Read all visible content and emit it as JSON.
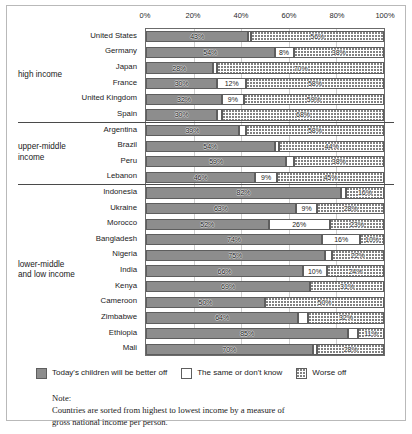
{
  "chart_data": {
    "type": "bar",
    "orientation": "horizontal",
    "stacked": true,
    "title": "",
    "xlabel": "",
    "ylabel": "",
    "xlim": [
      0,
      100
    ],
    "grid": true,
    "legend_position": "bottom",
    "axis_ticks": [
      "0%",
      "20%",
      "40%",
      "60%",
      "80%",
      "100%"
    ],
    "axis_tick_values": [
      0,
      20,
      40,
      60,
      80,
      100
    ],
    "series": [
      {
        "name": "Today's children will be better off",
        "key": "better",
        "color": "#8d8d8d",
        "pattern": "solid-gray"
      },
      {
        "name": "The same or don't know",
        "key": "same",
        "color": "#ffffff",
        "pattern": "white"
      },
      {
        "name": "Worse off",
        "key": "worse",
        "color": "#ffffff",
        "pattern": "dotted"
      }
    ],
    "groups": [
      {
        "label_lines": [
          "high income"
        ],
        "countries": [
          {
            "name": "United States",
            "better": 43,
            "same": 1,
            "worse": 56,
            "labels": {
              "better": "43%",
              "same": "",
              "worse": "56%"
            }
          },
          {
            "name": "Germany",
            "better": 54,
            "same": 8,
            "worse": 38,
            "labels": {
              "better": "54%",
              "same": "8%",
              "worse": "38%"
            }
          },
          {
            "name": "Japan",
            "better": 28,
            "same": 2,
            "worse": 70,
            "labels": {
              "better": "28%",
              "same": "",
              "worse": "70%"
            }
          },
          {
            "name": "France",
            "better": 30,
            "same": 12,
            "worse": 58,
            "labels": {
              "better": "30%",
              "same": "12%",
              "worse": "58%"
            }
          },
          {
            "name": "United Kingdom",
            "better": 32,
            "same": 9,
            "worse": 59,
            "labels": {
              "better": "32%",
              "same": "9%",
              "worse": "59%"
            }
          },
          {
            "name": "Spain",
            "better": 30,
            "same": 2,
            "worse": 68,
            "labels": {
              "better": "30%",
              "same": "",
              "worse": "68%"
            }
          }
        ]
      },
      {
        "label_lines": [
          "upper-middle",
          "income"
        ],
        "countries": [
          {
            "name": "Argentina",
            "better": 39,
            "same": 3,
            "worse": 58,
            "labels": {
              "better": "39%",
              "same": "",
              "worse": "58%"
            }
          },
          {
            "name": "Brazil",
            "better": 54,
            "same": 2,
            "worse": 44,
            "labels": {
              "better": "54%",
              "same": "",
              "worse": "44%"
            }
          },
          {
            "name": "Peru",
            "better": 59,
            "same": 3,
            "worse": 38,
            "labels": {
              "better": "59%",
              "same": "",
              "worse": "38%"
            }
          },
          {
            "name": "Lebanon",
            "better": 46,
            "same": 9,
            "worse": 45,
            "labels": {
              "better": "46%",
              "same": "9%",
              "worse": "45%"
            }
          }
        ]
      },
      {
        "label_lines": [
          "lower-middle",
          "and low income"
        ],
        "countries": [
          {
            "name": "Indonesia",
            "better": 82,
            "same": 2,
            "worse": 16,
            "labels": {
              "better": "82%",
              "same": "",
              "worse": "16%"
            }
          },
          {
            "name": "Ukraine",
            "better": 63,
            "same": 9,
            "worse": 28,
            "labels": {
              "better": "63%",
              "same": "9%",
              "worse": "28%"
            }
          },
          {
            "name": "Morocco",
            "better": 52,
            "same": 26,
            "worse": 23,
            "labels": {
              "better": "52%",
              "same": "26%",
              "worse": "23%"
            }
          },
          {
            "name": "Bangladesh",
            "better": 74,
            "same": 16,
            "worse": 10,
            "labels": {
              "better": "74%",
              "same": "16%",
              "worse": "10%"
            }
          },
          {
            "name": "Nigeria",
            "better": 75,
            "same": 3,
            "worse": 22,
            "labels": {
              "better": "75%",
              "same": "",
              "worse": "22%"
            }
          },
          {
            "name": "India",
            "better": 66,
            "same": 10,
            "worse": 24,
            "labels": {
              "better": "66%",
              "same": "10%",
              "worse": "24%"
            }
          },
          {
            "name": "Kenya",
            "better": 69,
            "same": 0,
            "worse": 31,
            "labels": {
              "better": "69%",
              "same": "",
              "worse": "31%"
            }
          },
          {
            "name": "Cameroon",
            "better": 50,
            "same": 0,
            "worse": 50,
            "labels": {
              "better": "50%",
              "same": "",
              "worse": "50%"
            }
          },
          {
            "name": "Zimbabwe",
            "better": 64,
            "same": 4,
            "worse": 32,
            "labels": {
              "better": "64%",
              "same": "",
              "worse": "32%"
            }
          },
          {
            "name": "Ethiopia",
            "better": 85,
            "same": 4,
            "worse": 11,
            "labels": {
              "better": "85%",
              "same": "",
              "worse": "11%"
            }
          },
          {
            "name": "Mali",
            "better": 70,
            "same": 2,
            "worse": 28,
            "labels": {
              "better": "70%",
              "same": "",
              "worse": "28%"
            }
          }
        ]
      }
    ]
  },
  "note": {
    "label": "Note:",
    "lines": [
      "Countries are sorted from highest to lowest income by a measure of",
      "gross national income per person."
    ]
  }
}
